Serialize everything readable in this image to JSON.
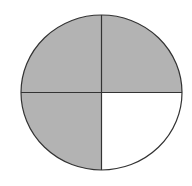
{
  "diagram": {
    "type": "fraction-circle",
    "total_parts": 4,
    "shaded_parts": 3,
    "shaded_quadrants": [
      "top-left",
      "top-right",
      "bottom-left"
    ],
    "unshaded_quadrants": [
      "bottom-right"
    ],
    "colors": {
      "shaded_fill": "#b3b3b3",
      "unshaded_fill": "#ffffff",
      "line": "#333333",
      "background": "#ffffff"
    },
    "geometry": {
      "cx": 101.5,
      "cy": 92.5,
      "rx": 80.5,
      "ry": 77.5
    }
  }
}
